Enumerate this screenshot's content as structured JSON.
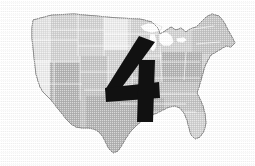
{
  "figure": {
    "background_color": "#ffffff",
    "width": 255,
    "height": 166
  },
  "overlay": {
    "name": "numeral-four",
    "value": "4",
    "color": "#111111",
    "style": "bold italic slab numeral",
    "position": "center-right of map, over the Midwest / Plains region"
  },
  "legend": {
    "shown": false,
    "shade_labels": []
  },
  "map": {
    "region": "Contiguous United States",
    "projection_look": "albers-like",
    "state_border_color": "#ffffff",
    "outline_color": "#8a8a8a",
    "lakes_color": "#ffffff",
    "shades": {
      "lightest": "#ededed",
      "light": "#e2e2e2",
      "medium_light": "#d2d2d2",
      "medium": "#c4c4c4",
      "medium_dark": "#b4b4b4",
      "dark": "#a6a6a6"
    },
    "shade_legend_order": [
      "lightest",
      "light",
      "medium_light",
      "medium",
      "medium_dark",
      "dark"
    ],
    "notes": "Grayscale halftone print; shading appears in broad vertical bands across the country with white Great Lakes.",
    "regions": [
      {
        "name": "pacific-northwest",
        "shade": "#e2e2e2"
      },
      {
        "name": "california-nevada",
        "shade": "#ededed"
      },
      {
        "name": "northern-rockies",
        "shade": "#d2d2d2"
      },
      {
        "name": "mountain-southwest",
        "shade": "#b4b4b4"
      },
      {
        "name": "northern-plains",
        "shade": "#d2d2d2"
      },
      {
        "name": "central-plains",
        "shade": "#c4c4c4"
      },
      {
        "name": "upper-midwest",
        "shade": "#ededed"
      },
      {
        "name": "great-lakes-states",
        "shade": "#d2d2d2"
      },
      {
        "name": "ohio-valley",
        "shade": "#c4c4c4"
      },
      {
        "name": "northeast",
        "shade": "#d2d2d2"
      },
      {
        "name": "new-england",
        "shade": "#c4c4c4"
      },
      {
        "name": "mid-atlantic",
        "shade": "#b4b4b4"
      },
      {
        "name": "southeast",
        "shade": "#c4c4c4"
      },
      {
        "name": "deep-south",
        "shade": "#b4b4b4"
      },
      {
        "name": "texas",
        "shade": "#b4b4b4"
      },
      {
        "name": "florida",
        "shade": "#d2d2d2"
      }
    ]
  }
}
